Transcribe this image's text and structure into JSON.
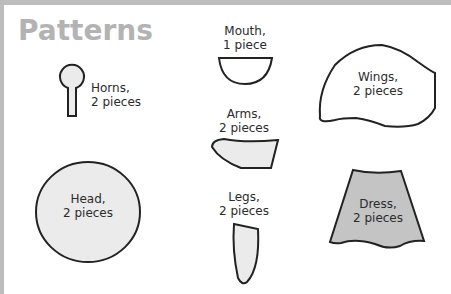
{
  "title": "Patterns",
  "pieces": {
    "horns": {
      "name": "Horns,",
      "count": "2 pieces"
    },
    "mouth": {
      "name": "Mouth,",
      "count": "1 piece"
    },
    "wings": {
      "name": "Wings,",
      "count": "2 pieces"
    },
    "arms": {
      "name": "Arms,",
      "count": "2 pieces"
    },
    "head": {
      "name": "Head,",
      "count": "2 pieces"
    },
    "legs": {
      "name": "Legs,",
      "count": "2 pieces"
    },
    "dress": {
      "name": "Dress,",
      "count": "2 pieces"
    }
  },
  "colors": {
    "title": "#b3b3b3",
    "light_fill": "#ebebeb",
    "dress_fill": "#c4c4c4",
    "outline": "#222222",
    "border": "#bdbdbd"
  }
}
